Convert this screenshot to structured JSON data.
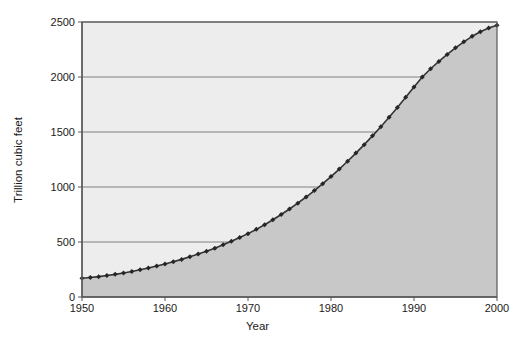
{
  "chart_data": {
    "type": "area",
    "title": "",
    "xlabel": "Year",
    "ylabel": "Trillion cubic feet",
    "xlim": [
      1950,
      2000
    ],
    "ylim": [
      0,
      2500
    ],
    "grid": true,
    "legend": false,
    "xticks": [
      1950,
      1960,
      1970,
      1980,
      1990,
      2000
    ],
    "xtick_labels": [
      "1950",
      "1960",
      "1970",
      "1980",
      "1990",
      "2000"
    ],
    "yticks": [
      0,
      500,
      1000,
      1500,
      2000,
      2500
    ],
    "ytick_labels": [
      "0",
      "500",
      "1000",
      "1500",
      "2000",
      "2500"
    ],
    "marker": "diamond",
    "series": [
      {
        "name": "Cumulative natural gas",
        "x": [
          1950,
          1951,
          1952,
          1953,
          1954,
          1955,
          1956,
          1957,
          1958,
          1959,
          1960,
          1961,
          1962,
          1963,
          1964,
          1965,
          1966,
          1967,
          1968,
          1969,
          1970,
          1971,
          1972,
          1973,
          1974,
          1975,
          1976,
          1977,
          1978,
          1979,
          1980,
          1981,
          1982,
          1983,
          1984,
          1985,
          1986,
          1987,
          1988,
          1989,
          1990,
          1991,
          1992,
          1993,
          1994,
          1995,
          1996,
          1997,
          1998,
          1999,
          2000
        ],
        "values": [
          170,
          177,
          185,
          195,
          206,
          218,
          232,
          247,
          263,
          281,
          300,
          320,
          342,
          365,
          390,
          416,
          444,
          474,
          506,
          540,
          576,
          615,
          657,
          702,
          750,
          800,
          853,
          909,
          968,
          1030,
          1095,
          1163,
          1234,
          1308,
          1385,
          1465,
          1548,
          1634,
          1723,
          1815,
          1910,
          2000,
          2075,
          2142,
          2205,
          2265,
          2320,
          2370,
          2412,
          2445,
          2470
        ]
      }
    ]
  },
  "colors": {
    "page_background": "#ffffff",
    "plot_background": "#ededed",
    "area_fill": "#c8c8c8",
    "gridline": "#808080",
    "axis_line": "#595959",
    "series_line": "#333333",
    "marker_fill": "#262626",
    "text": "#1a1a1a"
  }
}
